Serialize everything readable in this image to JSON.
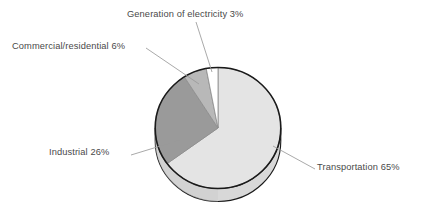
{
  "chart_data": {
    "type": "pie",
    "title": "",
    "subtitle": "",
    "xlabel": "",
    "ylabel": "",
    "legend_position": "none",
    "grid": false,
    "labels_on_slices": false,
    "label_style": "outside-with-leader-lines",
    "units": "percent",
    "total": 100,
    "start_angle_deg": 0,
    "direction": "clockwise",
    "three_d": true,
    "categories": [
      "Transportation",
      "Industrial",
      "Commercial/residential",
      "Generation of electricity"
    ],
    "values": [
      65,
      26,
      6,
      3
    ],
    "slices": [
      {
        "name": "Transportation",
        "value": 65,
        "label": "Transportation 65%",
        "color": "#e4e4e4"
      },
      {
        "name": "Industrial",
        "value": 26,
        "label": "Industrial 26%",
        "color": "#9a9a9a"
      },
      {
        "name": "Commercial/residential",
        "value": 6,
        "label": "Commercial/residential 6%",
        "color": "#b8b8b8"
      },
      {
        "name": "Generation of electricity",
        "value": 3,
        "label": "Generation of electricity 3%",
        "color": "#ffffff"
      }
    ],
    "colors": {
      "background": "#ffffff",
      "outline": "#1a1a1a",
      "slice_divider": "#8c8c8c",
      "leader_line": "#9a9a9a",
      "label_text": "#4a4a4a",
      "side_wall": "#d8d8d8",
      "side_wall_shadow": "#cdcdcd"
    }
  },
  "labels": {
    "generation": "Generation of electricity 3%",
    "commercial": "Commercial/residential 6%",
    "industrial": "Industrial 26%",
    "transportation": "Transportation 65%"
  }
}
